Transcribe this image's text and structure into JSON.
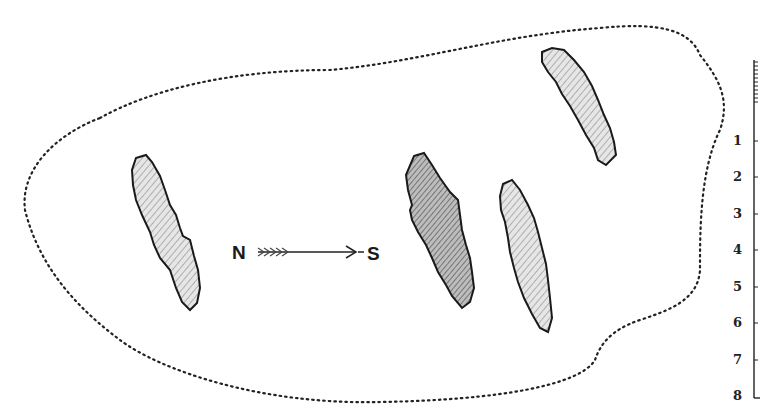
{
  "figure": {
    "type": "archaeological site plan",
    "compass": {
      "from_label": "N",
      "to_label": "S"
    },
    "features": [
      {
        "id": "stone-1",
        "shading": "light"
      },
      {
        "id": "stone-2",
        "shading": "dark-top"
      },
      {
        "id": "stone-3",
        "shading": "medium"
      },
      {
        "id": "stone-4",
        "shading": "medium"
      }
    ],
    "scale": {
      "ticks": [
        "1",
        "2",
        "3",
        "4",
        "5",
        "6",
        "7",
        "8"
      ]
    },
    "colors": {
      "ink": "#1a1a1a",
      "background": "#ffffff",
      "fill": "#cfcfcf"
    }
  }
}
